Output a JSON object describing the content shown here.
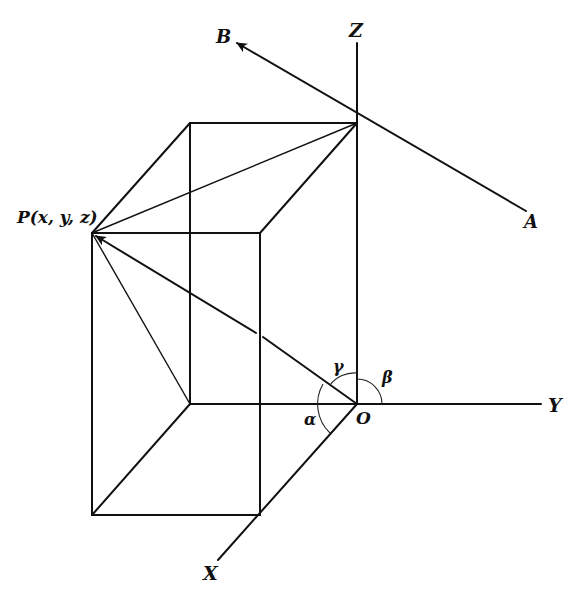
{
  "figure": {
    "type": "3d-coordinate-direction-angles",
    "colors": {
      "ink": "#111111",
      "background": "#ffffff"
    },
    "labels": {
      "z_axis": "Z",
      "y_axis": "Y",
      "x_axis": "X",
      "origin": "O",
      "point": "P(x, y, z)",
      "line_start": "A",
      "line_end": "B",
      "angle_x": "α",
      "angle_y": "β",
      "angle_z": "γ"
    }
  }
}
